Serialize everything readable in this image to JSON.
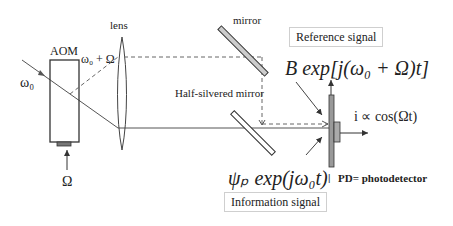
{
  "labels": {
    "aom": "AOM",
    "lens": "lens",
    "mirror": "mirror",
    "half_silvered_mirror": "Half-silvered mirror",
    "omega0": "ω₀",
    "omega0_plus_Omega": "ω₀ + Ω",
    "Omega_input": "Ω",
    "reference_signal": "Reference signal",
    "information_signal": "Information signal",
    "reference_formula": "B exp[j(ω₀ + Ω)t]",
    "information_formula": "ψₚ exp(jω₀t)",
    "output_current": "i ∝ cos(Ωt)",
    "pd_marker": "|",
    "pd_definition": "PD= photodetector"
  },
  "colors": {
    "line": "#555555",
    "dashed": "#666666",
    "mirror_fill": "#cccccc",
    "detector_fill": "#999999",
    "box_border": "#cfcfcf"
  }
}
